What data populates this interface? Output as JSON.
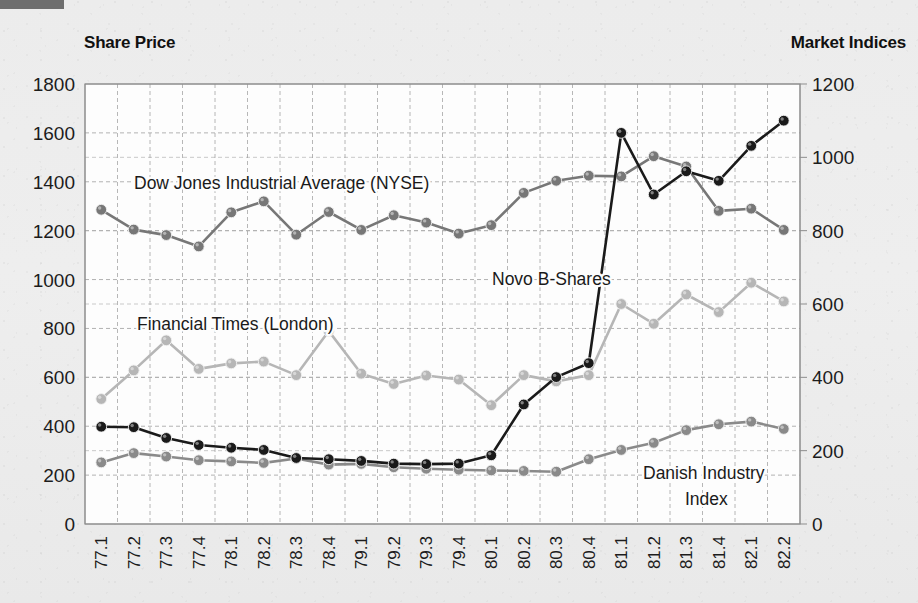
{
  "header": {
    "left_title": "Share Price",
    "right_title": "Market Indices"
  },
  "chart_data": {
    "type": "line",
    "title": "",
    "xlabel": "",
    "grid": true,
    "legend_position": "inline-annotations",
    "categories": [
      "77.1",
      "77.2",
      "77.3",
      "77.4",
      "78.1",
      "78.2",
      "78.3",
      "78.4",
      "79.1",
      "79.2",
      "79.3",
      "79.4",
      "80.1",
      "80.2",
      "80.3",
      "80.4",
      "81.1",
      "81.2",
      "81.3",
      "81.4",
      "82.1",
      "82.2"
    ],
    "axes": {
      "left": {
        "label": "Share Price",
        "ylim": [
          0,
          1800
        ],
        "ticks": [
          0,
          200,
          400,
          600,
          800,
          1000,
          1200,
          1400,
          1600,
          1800
        ],
        "tick_labels": [
          "0",
          "200",
          "400",
          "600",
          "800",
          "1000",
          "1200",
          "1400",
          "1600",
          "1800"
        ]
      },
      "right": {
        "label": "Market Indices",
        "ylim": [
          0,
          1200
        ],
        "ticks": [
          0,
          200,
          400,
          600,
          800,
          1000,
          1200
        ],
        "tick_labels": [
          "0",
          "200",
          "400",
          "600",
          "800",
          "1000",
          "1200"
        ]
      }
    },
    "series": [
      {
        "name": "Novo B-Shares",
        "axis": "left",
        "color": "#1a1a1a",
        "marker": "circle",
        "annotation": "Novo B-Shares",
        "values": [
          398,
          396,
          352,
          323,
          312,
          303,
          270,
          265,
          258,
          247,
          245,
          247,
          281,
          489,
          601,
          658,
          1600,
          1348,
          1443,
          1404,
          1547,
          1650
        ]
      },
      {
        "name": "Dow Jones Industrial Average (NYSE)",
        "axis": "right",
        "color": "#777777",
        "marker": "circle",
        "annotation": "Dow Jones Industrial Average (NYSE)",
        "values": [
          857,
          803,
          788,
          757,
          850,
          880,
          789,
          851,
          802,
          842,
          822,
          792,
          815,
          903,
          936,
          950,
          948,
          1003,
          975,
          854,
          860,
          802
        ]
      },
      {
        "name": "Financial Times (London)",
        "axis": "right",
        "color": "#b6b6b6",
        "marker": "circle",
        "annotation": "Financial Times (London)",
        "values": [
          341,
          419,
          501,
          423,
          438,
          443,
          406,
          526,
          410,
          382,
          405,
          394,
          324,
          406,
          389,
          406,
          600,
          546,
          626,
          578,
          658,
          607
        ]
      },
      {
        "name": "Danish Industry Index",
        "axis": "left",
        "color": "#8a8a8a",
        "marker": "circle",
        "annotation": "Danish Industry\nIndex",
        "values": [
          252,
          290,
          276,
          261,
          256,
          250,
          268,
          243,
          246,
          232,
          226,
          222,
          219,
          217,
          214,
          265,
          303,
          332,
          384,
          408,
          419,
          389
        ]
      }
    ],
    "annotations": [
      {
        "text": "Dow Jones Industrial Average (NYSE)",
        "series": "Dow Jones Industrial Average (NYSE)"
      },
      {
        "text": "Financial Times (London)",
        "series": "Financial Times (London)"
      },
      {
        "text": "Novo B-Shares",
        "series": "Novo B-Shares"
      },
      {
        "text": "Danish Industry",
        "series": "Danish Industry Index"
      },
      {
        "text": "Index",
        "series": "Danish Industry Index"
      }
    ]
  }
}
